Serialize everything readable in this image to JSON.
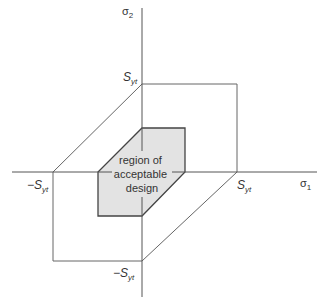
{
  "diagram": {
    "axes": {
      "x_label": "σ",
      "x_sub": "1",
      "y_label": "σ",
      "y_sub": "2"
    },
    "ticks": {
      "pos_x": {
        "main": "S",
        "sub": "yt"
      },
      "neg_x": {
        "prefix": "−",
        "main": "S",
        "sub": "yt"
      },
      "pos_y": {
        "main": "S",
        "sub": "yt"
      },
      "neg_y": {
        "prefix": "−",
        "main": "S",
        "sub": "yt"
      }
    },
    "region_label": [
      "region of",
      "acceptable",
      "design"
    ],
    "colors": {
      "line": "#555555",
      "region_fill": "#e3e3e3",
      "region_stroke": "#444444"
    }
  }
}
